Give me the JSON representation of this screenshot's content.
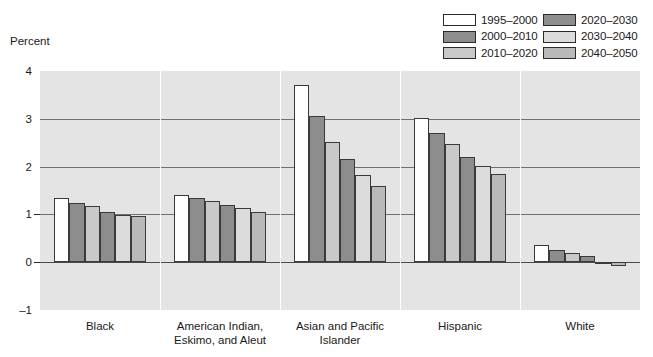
{
  "axis_title": "Percent",
  "legend": {
    "items": [
      {
        "label": "1995–2000",
        "color": "#ffffff"
      },
      {
        "label": "2000–2010",
        "color": "#8d8d8d"
      },
      {
        "label": "2010–2020",
        "color": "#c9c9c9"
      },
      {
        "label": "2020–2030",
        "color": "#8d8d8d"
      },
      {
        "label": "2030–2040",
        "color": "#dcdcdc"
      },
      {
        "label": "2040–2050",
        "color": "#b9b9b9"
      }
    ]
  },
  "chart_data": {
    "type": "bar",
    "title": "",
    "xlabel": "",
    "ylabel": "Percent",
    "ylim": [
      -1,
      4
    ],
    "yticks": [
      -1,
      0,
      1,
      2,
      3,
      4
    ],
    "ytick_labels": [
      "–1",
      "0",
      "1",
      "2",
      "3",
      "4"
    ],
    "gridlines": [
      0,
      1,
      2,
      3
    ],
    "grid": true,
    "legend_position": "top-right",
    "categories": [
      "Black",
      "American Indian,\nEskimo, and Aleut",
      "Asian and Pacific\nIslander",
      "Hispanic",
      "White"
    ],
    "series": [
      {
        "name": "1995–2000",
        "color": "#ffffff",
        "values": [
          1.35,
          1.4,
          3.7,
          3.02,
          0.36
        ]
      },
      {
        "name": "2000–2010",
        "color": "#8d8d8d",
        "values": [
          1.24,
          1.35,
          3.05,
          2.7,
          0.25
        ]
      },
      {
        "name": "2010–2020",
        "color": "#c9c9c9",
        "values": [
          1.17,
          1.28,
          2.52,
          2.47,
          0.2
        ]
      },
      {
        "name": "2020–2030",
        "color": "#8d8d8d",
        "values": [
          1.06,
          1.2,
          2.15,
          2.2,
          0.12
        ]
      },
      {
        "name": "2030–2040",
        "color": "#dcdcdc",
        "values": [
          0.98,
          1.14,
          1.83,
          2.02,
          -0.03
        ]
      },
      {
        "name": "2040–2050",
        "color": "#b9b9b9",
        "values": [
          0.96,
          1.05,
          1.6,
          1.85,
          -0.08
        ]
      }
    ]
  }
}
